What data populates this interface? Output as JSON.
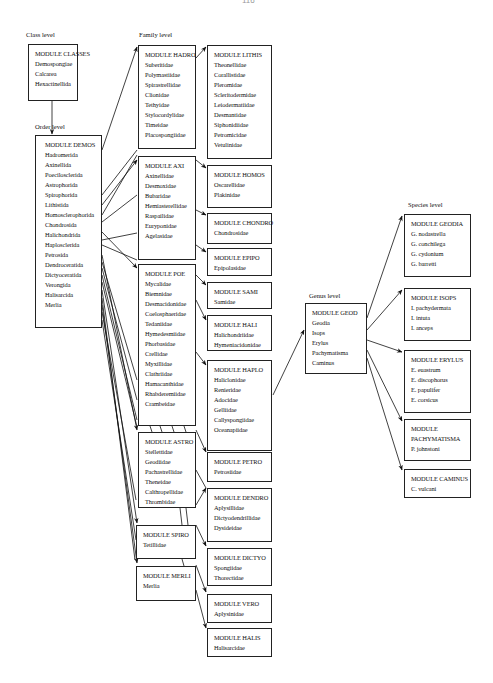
{
  "page_number": "116",
  "levels": {
    "class": "Class level",
    "order": "Order level",
    "family": "Family level",
    "genus": "Genus level",
    "species": "Species level"
  },
  "modules": {
    "classes": {
      "title": "MODULE CLASSES",
      "items": [
        "Demospongiae",
        "Calcarea",
        "Hexactinellida"
      ]
    },
    "demos": {
      "title": "MODULE DEMOS",
      "items": [
        "Hadromerida",
        "Axinellida",
        "Poecilosclerida",
        "Astrophorida",
        "Spirophorida",
        "Lithistida",
        "Homosclerophorida",
        "Chondrosida",
        "Halichondrida",
        "Haplosclerida",
        "Petrosida",
        "Dendroceratida",
        "Dictyoceratida",
        "Verongida",
        "Halisarcida",
        "Merlia"
      ]
    },
    "hadro": {
      "title": "MODULE HADRO",
      "items": [
        "Suberitidae",
        "Polymastiidae",
        "Spirastrellidae",
        "Clionidae",
        "Tethyidae",
        "Stylocordylidae",
        "Timeidae",
        "Placospongiidae"
      ]
    },
    "axi": {
      "title": "MODULE AXI",
      "items": [
        "Axinellidae",
        "Desmoxidae",
        "Bubaridae",
        "Hemiasterellidae",
        "Raspailidae",
        "Euryponidae",
        "Agelasidae"
      ]
    },
    "poe": {
      "title": "MODULE POE",
      "items": [
        "Mycalidae",
        "Biemnidae",
        "Desmacidonidae",
        "Coelosphaeridae",
        "Tedaniidae",
        "Hymedesmiidae",
        "Phorbasidae",
        "Crellidae",
        "Myxillidae",
        "Clathriidae",
        "Hamacanthidae",
        "Rhabderemiidae",
        "Crambeidae"
      ]
    },
    "astro": {
      "title": "MODULE ASTRO",
      "items": [
        "Stellettidae",
        "Geodiidae",
        "Pachastrellidae",
        "Theneidae",
        "Calthropellidae",
        "Thrombidae"
      ]
    },
    "spiro": {
      "title": "MODULE SPIRO",
      "items": [
        "Tetillidae"
      ]
    },
    "merli": {
      "title": "MODULE MERLI",
      "items": [
        "Merlia"
      ]
    },
    "lithis": {
      "title": "MODULE LITHIS",
      "items": [
        "Theonellidae",
        "Corallistidae",
        "Pleromidae",
        "Scleritodermidae",
        "Leiodermatiidae",
        "Desmantidae",
        "Siphonidiidae",
        "Petromicidae",
        "Vetulinidae"
      ]
    },
    "homos": {
      "title": "MODULE HOMOS",
      "items": [
        "Oscarellidae",
        "Plakinidae"
      ]
    },
    "chondro": {
      "title": "MODULE CHONDRO",
      "items": [
        "Chondrosidae"
      ]
    },
    "epipo": {
      "title": "MODULE EPIPO",
      "items": [
        "Epipolasidae"
      ]
    },
    "sami": {
      "title": "MODULE SAMI",
      "items": [
        "Samidae"
      ]
    },
    "hali": {
      "title": "MODULE HALI",
      "items": [
        "Halichondriidae",
        "Hymeniacidonidae"
      ]
    },
    "haplo": {
      "title": "MODULE HAPLO",
      "items": [
        "Haliclonidae",
        "Renieridae",
        "Adocidae",
        "Gelliidae",
        "Callyspongiidae",
        "Oceanapiidae"
      ]
    },
    "petro": {
      "title": "MODULE PETRO",
      "items": [
        "Petrosiidae"
      ]
    },
    "dendro": {
      "title": "MODULE DENDRO",
      "items": [
        "Aplysillidae",
        "Dictyodendrillidae",
        "Dysideidae"
      ]
    },
    "dictyo": {
      "title": "MODULE DICTYO",
      "items": [
        "Spongiidae",
        "Thorectidae"
      ]
    },
    "vero": {
      "title": "MODULE VERO",
      "items": [
        "Aplysinidae"
      ]
    },
    "halis": {
      "title": "MODULE HALIS",
      "items": [
        "Halisarcidae"
      ]
    },
    "geod": {
      "title": "MODULE GEOD",
      "items": [
        "Geodia",
        "Isops",
        "Erylus",
        "Pachymatisma",
        "Caminus"
      ]
    },
    "geodia": {
      "title": "MODULE GEODIA",
      "items": [
        "G. nodastrella",
        "G. conchilega",
        "G. cydonium",
        "G. barretti"
      ]
    },
    "isops": {
      "title": "MODULE ISOPS",
      "items": [
        "I. pachydermata",
        "I. intuta",
        "I. anceps"
      ]
    },
    "erylus": {
      "title": "MODULE ERYLUS",
      "items": [
        "E. euastrum",
        "E. discophorus",
        "E. papulifer",
        "E. corsicus"
      ]
    },
    "pachy": {
      "title": "MODULE PACHYMATISMA",
      "items": [
        "P. johnstoni"
      ]
    },
    "caminus": {
      "title": "MODULE CAMINUS",
      "items": [
        "C. vulcani"
      ]
    }
  }
}
